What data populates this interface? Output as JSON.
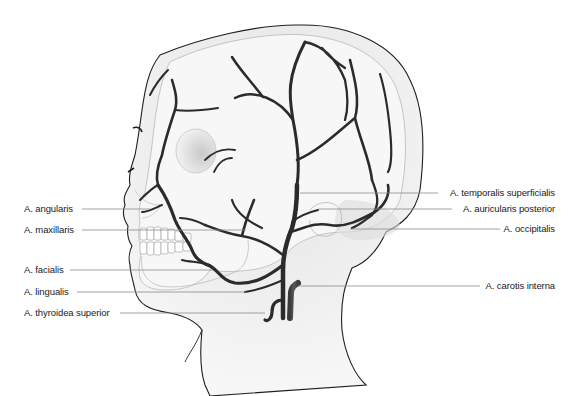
{
  "colors": {
    "artery": "#2b2b2b",
    "skin_fill": "#efefef",
    "skull_fill": "#f6f6f6",
    "outline": "#1e1e1e",
    "leader_line": "#8a8a8a",
    "label_text": "#1a1a1a"
  },
  "labels_left": [
    {
      "text": "A. angularis",
      "y": 209
    },
    {
      "text": "A. maxillaris",
      "y": 230
    },
    {
      "text": "A. facialis",
      "y": 270
    },
    {
      "text": "A. lingualis",
      "y": 292
    },
    {
      "text": "A. thyroidea superior",
      "y": 313
    }
  ],
  "labels_right": [
    {
      "text": "A. temporalis superficialis",
      "y": 193
    },
    {
      "text": "A. auricularis posterior",
      "y": 209
    },
    {
      "text": "A. occipitalis",
      "y": 229
    },
    {
      "text": "A. carotis interna",
      "y": 286
    }
  ]
}
